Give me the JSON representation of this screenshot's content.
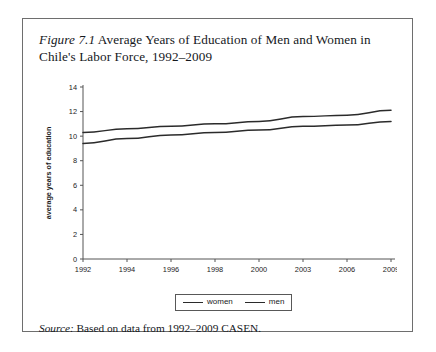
{
  "figure": {
    "number_label": "Figure 7.1",
    "title_text": " Average Years of Education of Men and Women in Chile's Labor Force, 1992–2009",
    "source_label": "Source:",
    "source_text": " Based on data from 1992–2009 CASEN."
  },
  "legend": {
    "items": [
      {
        "label": "women",
        "color": "#2b2b2b"
      },
      {
        "label": "men",
        "color": "#2b2b2b"
      }
    ]
  },
  "chart_data": {
    "type": "line",
    "xlabel": "",
    "ylabel": "average years of education",
    "categories": [
      "1992",
      "1994",
      "1996",
      "1998",
      "2000",
      "2003",
      "2006",
      "2009"
    ],
    "x_tick_labels": [
      "1992",
      "1994",
      "1996",
      "1998",
      "2000",
      "2003",
      "2006",
      "2009"
    ],
    "y_tick_labels": [
      "0",
      "2",
      "4",
      "6",
      "8",
      "10",
      "12",
      "14"
    ],
    "y_ticks": [
      0,
      2,
      4,
      6,
      8,
      10,
      12,
      14
    ],
    "ylim": [
      0,
      14
    ],
    "grid": false,
    "legend_position": "bottom",
    "series": [
      {
        "name": "women",
        "color": "#2b2b2b",
        "values": [
          10.3,
          10.6,
          10.8,
          11.0,
          11.2,
          11.6,
          11.7,
          12.1
        ]
      },
      {
        "name": "men",
        "color": "#2b2b2b",
        "values": [
          9.4,
          9.8,
          10.1,
          10.3,
          10.5,
          10.8,
          10.9,
          11.2
        ]
      }
    ]
  }
}
